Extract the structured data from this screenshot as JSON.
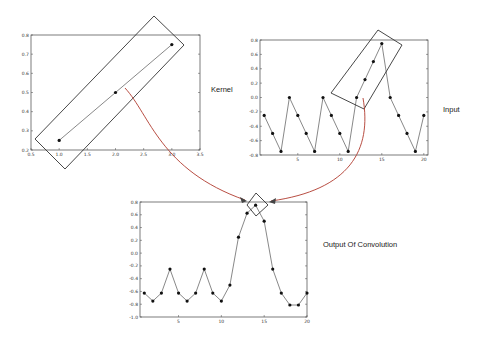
{
  "labels": {
    "kernel": "Kernel",
    "input": "Input",
    "output": "Output Of Convolution"
  },
  "chart_data": [
    {
      "name": "kernel",
      "type": "line",
      "x": [
        1,
        2,
        3
      ],
      "values": [
        0.25,
        0.5,
        0.75
      ],
      "xlim": [
        0.5,
        3.5
      ],
      "ylim": [
        0.2,
        0.8
      ],
      "xticks": [
        "0.5",
        "1.0",
        "1.5",
        "2.0",
        "2.5",
        "3.0",
        "3.5"
      ],
      "yticks": [
        "0.2",
        "0.3",
        "0.4",
        "0.5",
        "0.6",
        "0.7",
        "0.8"
      ],
      "title": "",
      "xlabel": "",
      "ylabel": "",
      "grid": false
    },
    {
      "name": "input",
      "type": "line",
      "x": [
        1,
        2,
        3,
        4,
        5,
        6,
        7,
        8,
        9,
        10,
        11,
        12,
        13,
        14,
        15,
        16,
        17,
        18,
        19,
        20
      ],
      "values": [
        -0.25,
        -0.5,
        -0.75,
        0,
        -0.25,
        -0.5,
        -0.75,
        0,
        -0.25,
        -0.5,
        -0.75,
        0,
        0.25,
        0.5,
        0.75,
        0,
        -0.25,
        -0.5,
        -0.75,
        -0.25
      ],
      "xlim": [
        0.5,
        20.5
      ],
      "ylim": [
        -0.8,
        0.8
      ],
      "xticks": [
        "5",
        "10",
        "15",
        "20"
      ],
      "yticks": [
        "-0.8",
        "-0.6",
        "-0.4",
        "-0.2",
        "0.0",
        "0.2",
        "0.4",
        "0.6",
        "0.8"
      ],
      "title": "",
      "xlabel": "",
      "ylabel": "",
      "grid": false
    },
    {
      "name": "output_of_convolution",
      "type": "line",
      "x": [
        1,
        2,
        3,
        4,
        5,
        6,
        7,
        8,
        9,
        10,
        11,
        12,
        13,
        14,
        15,
        16,
        17,
        18,
        19,
        20
      ],
      "values": [
        -0.625,
        -0.75,
        -0.625,
        -0.25,
        -0.625,
        -0.75,
        -0.625,
        -0.25,
        -0.625,
        -0.75,
        -0.5,
        0.25,
        0.625,
        0.75,
        0.5,
        -0.25,
        -0.625,
        -0.8125,
        -0.8125,
        -0.625
      ],
      "xlim": [
        0.5,
        20
      ],
      "ylim": [
        -1.0,
        0.8
      ],
      "xticks": [
        "5",
        "10",
        "15",
        "20"
      ],
      "yticks": [
        "-1.0",
        "-0.8",
        "-0.6",
        "-0.4",
        "-0.2",
        "0.0",
        "0.2",
        "0.4",
        "0.6",
        "0.8"
      ],
      "title": "",
      "xlabel": "",
      "ylabel": "",
      "grid": false
    }
  ]
}
